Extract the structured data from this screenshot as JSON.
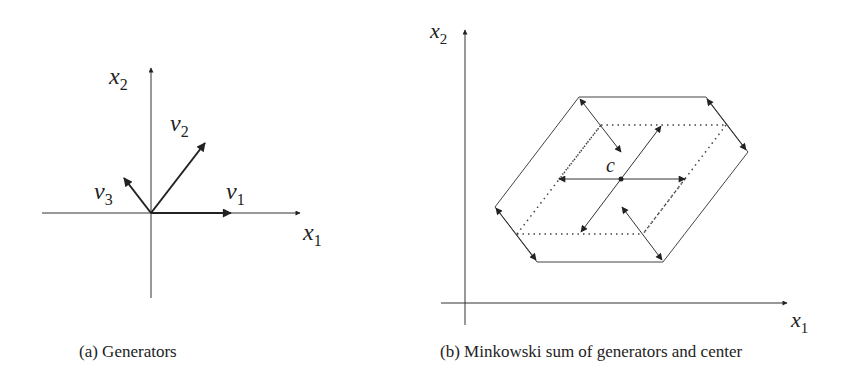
{
  "panel_a": {
    "caption": "(a)  Generators",
    "axis_x_label": "x",
    "axis_x_sub": "1",
    "axis_y_label": "x",
    "axis_y_sub": "2",
    "vectors": [
      {
        "name": "v",
        "sub": "1"
      },
      {
        "name": "v",
        "sub": "2"
      },
      {
        "name": "v",
        "sub": "3"
      }
    ]
  },
  "panel_b": {
    "caption": "(b)  Minkowski sum of generators and center",
    "axis_x_label": "x",
    "axis_x_sub": "1",
    "axis_y_label": "x",
    "axis_y_sub": "2",
    "center_label": "c"
  },
  "colors": {
    "line": "#333333",
    "text": "#222222"
  }
}
